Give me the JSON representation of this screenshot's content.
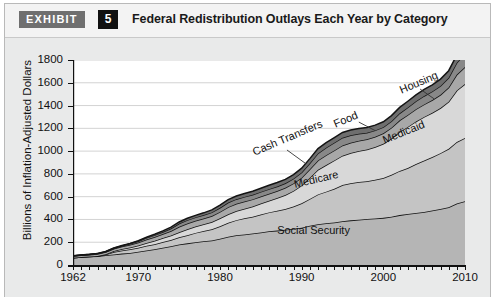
{
  "header": {
    "exhibit_label": "EXHIBIT",
    "exhibit_number": "5",
    "title": "Federal Redistribution Outlays Each Year by Category"
  },
  "chart_data": {
    "type": "area",
    "stacked": true,
    "title": "Federal Redistribution Outlays Each Year by Category",
    "xlabel": "",
    "ylabel": "Billions of Inflation-Adjusted Dollars",
    "xlim": [
      1962,
      2010
    ],
    "ylim": [
      0,
      1800
    ],
    "ytick_step": 200,
    "xtick_labels": [
      "1962",
      "1970",
      "1980",
      "1990",
      "2000",
      "2010"
    ],
    "xtick_values": [
      1962,
      1970,
      1980,
      1990,
      2000,
      2010
    ],
    "ytick_labels": [
      "0",
      "200",
      "400",
      "600",
      "800",
      "1000",
      "1200",
      "1400",
      "1600",
      "1800"
    ],
    "ytick_values": [
      0,
      200,
      400,
      600,
      800,
      1000,
      1200,
      1400,
      1600,
      1800
    ],
    "grid": true,
    "minor_xticks": "every year",
    "legend_position": "inline-labels",
    "x": [
      1962,
      1963,
      1964,
      1965,
      1966,
      1967,
      1968,
      1969,
      1970,
      1971,
      1972,
      1973,
      1974,
      1975,
      1976,
      1977,
      1978,
      1979,
      1980,
      1981,
      1982,
      1983,
      1984,
      1985,
      1986,
      1987,
      1988,
      1989,
      1990,
      1991,
      1992,
      1993,
      1994,
      1995,
      1996,
      1997,
      1998,
      1999,
      2000,
      2001,
      2002,
      2003,
      2004,
      2005,
      2006,
      2007,
      2008,
      2009,
      2010
    ],
    "series": [
      {
        "name": "Social Security",
        "color": "#b5b5b5",
        "values": [
          64,
          70,
          74,
          78,
          85,
          92,
          100,
          106,
          116,
          128,
          138,
          152,
          164,
          180,
          190,
          200,
          208,
          216,
          230,
          248,
          262,
          268,
          276,
          286,
          296,
          302,
          310,
          318,
          328,
          344,
          358,
          366,
          374,
          384,
          392,
          398,
          404,
          408,
          414,
          424,
          438,
          448,
          456,
          466,
          478,
          492,
          508,
          540,
          560
        ]
      },
      {
        "name": "Medicare",
        "color": "#c4c4c4",
        "values": [
          0,
          0,
          0,
          0,
          6,
          22,
          28,
          32,
          36,
          40,
          44,
          50,
          56,
          64,
          72,
          82,
          90,
          98,
          110,
          122,
          132,
          142,
          148,
          158,
          166,
          174,
          182,
          196,
          214,
          236,
          262,
          278,
          296,
          318,
          326,
          330,
          332,
          340,
          350,
          368,
          388,
          404,
          430,
          452,
          470,
          490,
          512,
          540,
          556
        ]
      },
      {
        "name": "Medicaid",
        "color": "#d8d8d8",
        "values": [
          0,
          0,
          0,
          2,
          4,
          8,
          12,
          16,
          20,
          26,
          30,
          34,
          38,
          44,
          52,
          56,
          60,
          64,
          70,
          76,
          80,
          84,
          90,
          96,
          102,
          112,
          122,
          136,
          156,
          186,
          216,
          234,
          248,
          258,
          266,
          272,
          278,
          288,
          300,
          318,
          342,
          360,
          374,
          382,
          388,
          396,
          414,
          452,
          474
        ]
      },
      {
        "name": "Cash Transfers",
        "color": "#a8a8a8",
        "values": [
          14,
          15,
          16,
          17,
          18,
          20,
          22,
          24,
          26,
          30,
          34,
          36,
          40,
          48,
          50,
          50,
          50,
          52,
          56,
          62,
          64,
          64,
          62,
          62,
          62,
          62,
          64,
          66,
          68,
          74,
          82,
          86,
          88,
          90,
          90,
          90,
          90,
          90,
          92,
          96,
          102,
          106,
          108,
          110,
          112,
          116,
          124,
          140,
          148
        ]
      },
      {
        "name": "Food",
        "color": "#888888",
        "values": [
          2,
          2,
          3,
          3,
          4,
          5,
          6,
          8,
          10,
          14,
          16,
          18,
          22,
          28,
          30,
          30,
          30,
          32,
          36,
          40,
          40,
          40,
          40,
          40,
          40,
          40,
          40,
          42,
          46,
          54,
          62,
          66,
          68,
          68,
          66,
          62,
          58,
          56,
          54,
          56,
          62,
          66,
          70,
          74,
          76,
          78,
          86,
          104,
          118
        ]
      },
      {
        "name": "Housing",
        "color": "#6e6e6e",
        "values": [
          1,
          1,
          1,
          2,
          2,
          3,
          3,
          4,
          5,
          6,
          8,
          10,
          12,
          14,
          16,
          18,
          20,
          22,
          24,
          26,
          28,
          30,
          32,
          32,
          34,
          34,
          34,
          36,
          38,
          40,
          42,
          44,
          44,
          46,
          46,
          46,
          46,
          46,
          48,
          50,
          52,
          54,
          56,
          58,
          58,
          60,
          62,
          68,
          72
        ]
      }
    ],
    "annotations": [
      {
        "label": "Social Security",
        "x": 1987,
        "y": 300,
        "rotation": 0
      },
      {
        "label": "Medicare",
        "x": 1989,
        "y": 700,
        "rotation": -13
      },
      {
        "label": "Medicaid",
        "x": 2000,
        "y": 1090,
        "rotation": -22
      },
      {
        "label": "Cash Transfers",
        "x": 1984,
        "y": 980,
        "rotation": -23
      },
      {
        "label": "Food",
        "x": 1994,
        "y": 1230,
        "rotation": -23
      },
      {
        "label": "Housing",
        "x": 2002,
        "y": 1530,
        "rotation": -23
      }
    ]
  }
}
